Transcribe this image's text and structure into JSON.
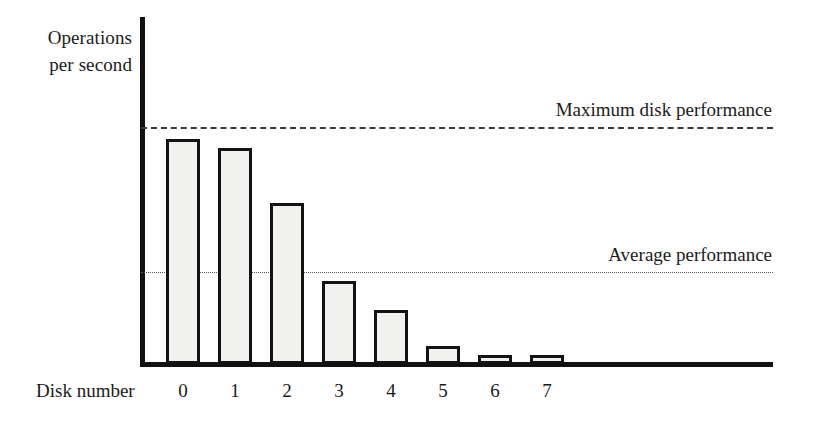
{
  "chart_data": {
    "type": "bar",
    "title": "",
    "subtitle": "",
    "ylabel": "Operations\nper second",
    "xlabel": "Disk number",
    "categories": [
      "0",
      "1",
      "2",
      "3",
      "4",
      "5",
      "6",
      "7"
    ],
    "values": [
      95,
      91,
      68,
      35,
      23,
      7.5,
      4,
      4
    ],
    "ylim": [
      0,
      100
    ],
    "grid": false,
    "legend_position": "none",
    "series": [
      {
        "name": "Operations per second",
        "values": [
          95,
          91,
          68,
          35,
          23,
          7.5,
          4,
          4
        ]
      }
    ],
    "annotations": [
      {
        "name": "maximum-disk-performance",
        "label": "Maximum disk performance",
        "value": 100,
        "line_style": "dashed"
      },
      {
        "name": "average-performance",
        "label": "Average performance",
        "value": 39,
        "line_style": "dotted"
      }
    ],
    "colors": {
      "bar_fill": "#f1f1ef",
      "bar_border": "#131313",
      "axis": "#111111",
      "max_line": "#3a3a3a",
      "avg_line": "#555555",
      "text": "#1b1b1b"
    }
  },
  "axes": {
    "y_label": "Operations\nper second",
    "x_label": "Disk number"
  },
  "reference_lines": {
    "max_label": "Maximum disk performance",
    "avg_label": "Average performance"
  },
  "ticks": {
    "x": [
      "0",
      "1",
      "2",
      "3",
      "4",
      "5",
      "6",
      "7"
    ]
  }
}
